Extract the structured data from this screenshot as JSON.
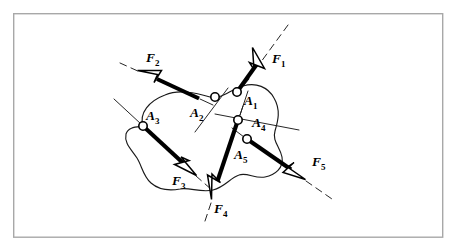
{
  "figure": {
    "kind": "free-body-diagram",
    "frame": {
      "x": 13,
      "y": 13,
      "width": 430,
      "height": 224,
      "border_color": "#a8a8a8",
      "background_color": "#ffffff"
    },
    "ink_color": "#000000",
    "outline_color": "#1a1a1a",
    "arrowhead_fill": "#ffffff"
  },
  "forces": [
    {
      "label": "F",
      "subscript": "1",
      "label_x": 273,
      "label_y": 62,
      "point": "A1",
      "shaft": {
        "x1": 237,
        "y1": 92,
        "x2": 259.5,
        "y2": 60.5
      },
      "head": {
        "tip_x": 252.5,
        "tip_y": 47.5,
        "angle_deg": -54.5
      },
      "action_line": {
        "x1": 288,
        "y1": 25,
        "x2": 249,
        "y2": 79
      },
      "direction": "up-right"
    },
    {
      "label": "F",
      "subscript": "2",
      "label_x": 148,
      "label_y": 62,
      "point": "A2",
      "shaft": {
        "x1": 198,
        "y1": 98,
        "x2": 157,
        "y2": 79
      },
      "head": {
        "tip_x": 138,
        "tip_y": 70.5,
        "angle_deg": 204.5
      },
      "action_line": {
        "x1": 120,
        "y1": 63,
        "x2": 210,
        "y2": 104
      },
      "direction": "up-left"
    },
    {
      "label": "F",
      "subscript": "3",
      "label_x": 178,
      "label_y": 183,
      "point": "A3",
      "shaft": {
        "x1": 143,
        "y1": 126,
        "x2": 182,
        "y2": 162
      },
      "head": {
        "tip_x": 196,
        "tip_y": 175,
        "angle_deg": 42.5
      },
      "action_line": {
        "x1": 114,
        "y1": 99,
        "x2": 210,
        "y2": 188
      },
      "direction": "down-right"
    },
    {
      "label": "F",
      "subscript": "4",
      "label_x": 214,
      "label_y": 212,
      "point": "A4",
      "shaft": {
        "x1": 238,
        "y1": 120,
        "x2": 217,
        "y2": 181
      },
      "head": {
        "tip_x": 212,
        "tip_y": 199,
        "angle_deg": 109
      },
      "action_line": {
        "x1": 248,
        "y1": 91,
        "x2": 205,
        "y2": 222
      },
      "direction": "down"
    },
    {
      "label": "F",
      "subscript": "5",
      "label_x": 312,
      "label_y": 165,
      "point": "A5",
      "shaft": {
        "x1": 247,
        "y1": 139,
        "x2": 290,
        "y2": 169
      },
      "head": {
        "tip_x": 305,
        "tip_y": 179,
        "angle_deg": 34.5
      },
      "action_line": {
        "x1": 232,
        "y1": 128,
        "x2": 330,
        "y2": 197
      },
      "direction": "down-right"
    }
  ],
  "application_points": [
    {
      "label": "A",
      "subscript": "1",
      "cx": 237,
      "cy": 92,
      "r": 4.2,
      "label_x": 245,
      "label_y": 104
    },
    {
      "label": "A",
      "subscript": "2",
      "cx": 215,
      "cy": 97,
      "r": 4.2,
      "label_x": 194,
      "label_y": 116
    },
    {
      "label": "A",
      "subscript": "3",
      "cx": 143,
      "cy": 126,
      "r": 4.2,
      "label_x": 146,
      "label_y": 119
    },
    {
      "label": "A",
      "subscript": "4",
      "cx": 238,
      "cy": 120,
      "r": 4.2,
      "label_x": 252,
      "label_y": 126
    },
    {
      "label": "A",
      "subscript": "5",
      "cx": 247,
      "cy": 139,
      "r": 4.2,
      "label_x": 237,
      "label_y": 158
    }
  ],
  "extra_action_lines": [
    {
      "name": "a2-secondary",
      "x1": 195,
      "y1": 132,
      "x2": 228,
      "y2": 88
    },
    {
      "name": "a4-secondary",
      "x1": 215,
      "y1": 114,
      "x2": 298,
      "y2": 129
    },
    {
      "name": "a4-tick",
      "x1": 242,
      "y1": 107,
      "x2": 240,
      "y2": 115
    }
  ],
  "body_outline_path": "M 143 126 C 140 112, 150 100, 166 94 C 180 88, 196 92, 210 96 C 222 99, 232 88, 243 85 C 256 81, 268 86, 274 97 C 281 109, 279 120, 276 130 C 273 140, 280 146, 282 156 C 284 167, 276 174, 266 176 C 256 178, 248 172, 240 174 C 231 176, 226 186, 214 189 C 202 192, 190 187, 181 189 C 170 191, 160 190, 152 183 C 144 176, 143 166, 138 158 C 132 149, 125 143, 126 134 C 127 127, 135 127, 143 126 Z"
}
